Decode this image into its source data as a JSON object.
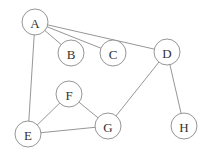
{
  "diagram": {
    "type": "undirected-graph",
    "node_radius": 13,
    "colors": {
      "stroke": "#8a8a8a",
      "text": "#333333",
      "fill": "#ffffff"
    },
    "nodes": [
      {
        "id": "A",
        "label": "A",
        "x": 35,
        "y": 22
      },
      {
        "id": "B",
        "label": "B",
        "x": 71,
        "y": 53
      },
      {
        "id": "C",
        "label": "C",
        "x": 113,
        "y": 53
      },
      {
        "id": "D",
        "label": "D",
        "x": 167,
        "y": 52
      },
      {
        "id": "F",
        "label": "F",
        "x": 69,
        "y": 94
      },
      {
        "id": "E",
        "label": "E",
        "x": 28,
        "y": 134
      },
      {
        "id": "G",
        "label": "G",
        "x": 108,
        "y": 126
      },
      {
        "id": "H",
        "label": "H",
        "x": 184,
        "y": 126
      }
    ],
    "edges": [
      {
        "from": "A",
        "to": "B"
      },
      {
        "from": "A",
        "to": "C"
      },
      {
        "from": "A",
        "to": "D"
      },
      {
        "from": "A",
        "to": "E"
      },
      {
        "from": "D",
        "to": "G"
      },
      {
        "from": "D",
        "to": "H"
      },
      {
        "from": "F",
        "to": "E"
      },
      {
        "from": "F",
        "to": "G"
      },
      {
        "from": "E",
        "to": "G"
      }
    ]
  }
}
